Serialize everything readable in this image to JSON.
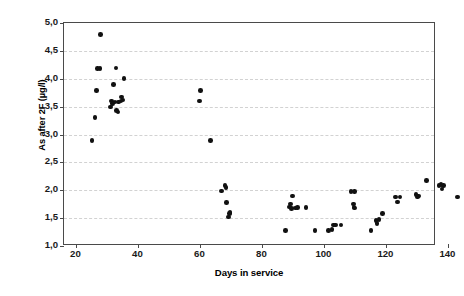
{
  "chart_data": {
    "type": "scatter",
    "title": "",
    "xlabel": "Days in service",
    "ylabel": "As after 2F (µg/l)",
    "xlim": [
      16,
      136
    ],
    "ylim": [
      1.0,
      5.0
    ],
    "xticks": [
      20,
      40,
      60,
      80,
      100,
      120,
      140
    ],
    "xtick_labels": [
      "20",
      "40",
      "60",
      "80",
      "100",
      "120",
      "140"
    ],
    "yticks": [
      1.0,
      1.5,
      2.0,
      2.5,
      3.0,
      3.5,
      4.0,
      4.5,
      5.0
    ],
    "ytick_labels": [
      "1,0",
      "1,5",
      "2,0",
      "2,5",
      "3,0",
      "3,5",
      "4,0",
      "4,5",
      "5,0"
    ],
    "grid": "horizontal-dashed",
    "legend": "none",
    "marker": {
      "shape": "circle",
      "color": "#111111",
      "size": 4.6
    },
    "series": [
      {
        "name": "As after 2F",
        "points": [
          [
            25.0,
            2.89
          ],
          [
            26.0,
            3.3
          ],
          [
            26.4,
            3.79
          ],
          [
            26.8,
            4.18
          ],
          [
            27.6,
            4.18
          ],
          [
            27.8,
            4.79
          ],
          [
            31.0,
            3.49
          ],
          [
            31.4,
            3.6
          ],
          [
            31.6,
            3.56
          ],
          [
            32.0,
            3.9
          ],
          [
            32.4,
            3.58
          ],
          [
            32.8,
            4.19
          ],
          [
            33.0,
            3.43
          ],
          [
            33.4,
            3.4
          ],
          [
            33.6,
            3.58
          ],
          [
            34.4,
            3.6
          ],
          [
            34.6,
            3.67
          ],
          [
            35.0,
            3.62
          ],
          [
            35.4,
            4.0
          ],
          [
            59.8,
            3.6
          ],
          [
            60.0,
            3.79
          ],
          [
            63.2,
            2.89
          ],
          [
            66.8,
            1.99
          ],
          [
            68.0,
            2.08
          ],
          [
            68.2,
            2.05
          ],
          [
            68.4,
            1.78
          ],
          [
            69.0,
            1.52
          ],
          [
            69.4,
            1.58
          ],
          [
            69.6,
            1.6
          ],
          [
            87.4,
            1.28
          ],
          [
            88.8,
            1.7
          ],
          [
            89.0,
            1.75
          ],
          [
            89.4,
            1.67
          ],
          [
            89.8,
            1.9
          ],
          [
            90.6,
            1.68
          ],
          [
            91.4,
            1.69
          ],
          [
            94.0,
            1.69
          ],
          [
            97.0,
            1.28
          ],
          [
            101.4,
            1.28
          ],
          [
            102.4,
            1.3
          ],
          [
            103.0,
            1.38
          ],
          [
            103.6,
            1.38
          ],
          [
            105.4,
            1.38
          ],
          [
            108.6,
            1.98
          ],
          [
            109.8,
            1.98
          ],
          [
            109.4,
            1.75
          ],
          [
            109.6,
            1.7
          ],
          [
            109.8,
            1.68
          ],
          [
            115.0,
            1.28
          ],
          [
            116.6,
            1.46
          ],
          [
            117.0,
            1.4
          ],
          [
            117.6,
            1.48
          ],
          [
            118.8,
            1.58
          ],
          [
            123.0,
            1.88
          ],
          [
            123.6,
            1.79
          ],
          [
            124.4,
            1.88
          ],
          [
            129.6,
            1.92
          ],
          [
            130.0,
            1.88
          ],
          [
            130.4,
            1.9
          ],
          [
            133.0,
            2.18
          ],
          [
            137.0,
            2.08
          ],
          [
            137.6,
            2.1
          ],
          [
            138.0,
            2.02
          ],
          [
            138.4,
            2.08
          ],
          [
            143.0,
            1.88
          ]
        ]
      }
    ]
  },
  "axis": {
    "y_title": "As after 2F (µg/l)",
    "x_title": "Days in service"
  }
}
